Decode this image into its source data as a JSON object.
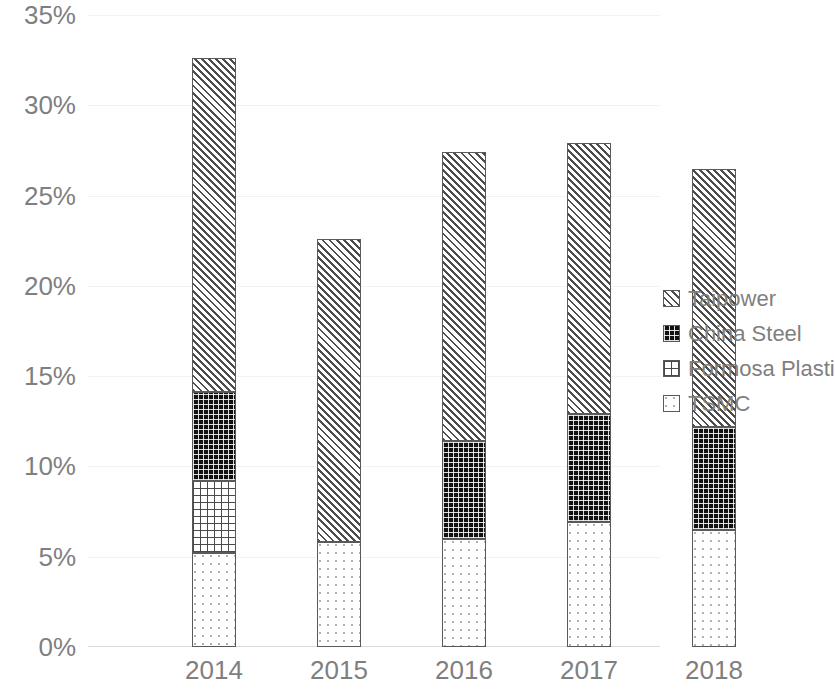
{
  "chart_data": {
    "type": "bar",
    "subtype": "stacked-bar",
    "title": "",
    "xlabel": "",
    "ylabel": "",
    "categories": [
      "2014",
      "2015",
      "2016",
      "2017",
      "2018"
    ],
    "ylim": [
      0,
      35
    ],
    "ytick_values": [
      0,
      5,
      10,
      15,
      20,
      25,
      30,
      35
    ],
    "ytick_labels": [
      "0%",
      "5%",
      "10%",
      "15%",
      "20%",
      "25%",
      "30%",
      "35%"
    ],
    "y_unit": "%",
    "grid": true,
    "grid_axis": "y",
    "legend_position": "right",
    "stack_order_bottom_to_top": [
      "TSMC",
      "Formosa Plastic",
      "China Steel",
      "Taipower"
    ],
    "series": [
      {
        "name": "TSMC",
        "values": [
          5.2,
          5.8,
          6.0,
          6.9,
          6.5
        ]
      },
      {
        "name": "Formosa Plastic",
        "values": [
          4.0,
          0.0,
          0.0,
          0.0,
          0.0
        ]
      },
      {
        "name": "China Steel",
        "values": [
          4.9,
          0.0,
          5.4,
          6.0,
          5.7
        ]
      },
      {
        "name": "Taipower",
        "values": [
          18.5,
          16.8,
          16.0,
          15.0,
          14.3
        ]
      }
    ],
    "totals": [
      32.6,
      22.6,
      27.4,
      27.9,
      26.5
    ]
  },
  "legend": {
    "items": [
      {
        "label": "Taipower",
        "pattern": "diagonal-hatch"
      },
      {
        "label": "China Steel",
        "pattern": "dark-dotted-grid"
      },
      {
        "label": "Formosa Plastic",
        "pattern": "crosshatch-grid"
      },
      {
        "label": "TSMC",
        "pattern": "light-dots"
      }
    ]
  },
  "axis": {
    "y_labels": [
      "35%",
      "30%",
      "25%",
      "20%",
      "15%",
      "10%",
      "5%",
      "0%"
    ],
    "x_labels": [
      "2014",
      "2015",
      "2016",
      "2017",
      "2018"
    ]
  },
  "colors": {
    "tick_text": "#7f7f7f",
    "gridline": "#f2f2f2",
    "bar_outline": "#595959",
    "plot_background": "#ffffff"
  }
}
